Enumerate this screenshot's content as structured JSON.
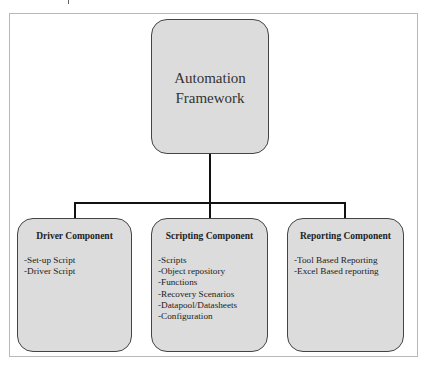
{
  "diagram": {
    "root": {
      "title_line1": "Automation",
      "title_line2": "Framework"
    },
    "children": [
      {
        "title": "Driver Component",
        "items": [
          "-Set-up Script",
          "-Driver Script"
        ]
      },
      {
        "title": "Scripting Component",
        "items": [
          "-Scripts",
          "-Object repository",
          "-Functions",
          "-Recovery Scenarios",
          "-Datapool/Datasheets",
          "-Configuration"
        ]
      },
      {
        "title": "Reporting Component",
        "items": [
          "-Tool Based Reporting",
          "-Excel Based reporting"
        ]
      }
    ]
  }
}
